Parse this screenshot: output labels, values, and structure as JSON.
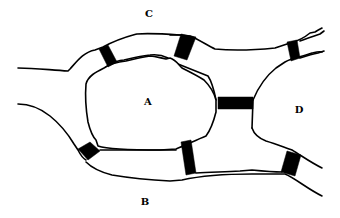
{
  "diagram": {
    "background": "#ffffff",
    "line_color": "#000000",
    "regions": [
      {
        "id": "C",
        "label": "C",
        "x": 149,
        "y": 14
      },
      {
        "id": "A",
        "label": "A",
        "x": 148,
        "y": 102
      },
      {
        "id": "D",
        "label": "D",
        "x": 299,
        "y": 110
      },
      {
        "id": "B",
        "label": "B",
        "x": 145,
        "y": 202
      }
    ],
    "bridges": [
      {
        "id": "bridge-1",
        "connects": [
          "C",
          "A"
        ]
      },
      {
        "id": "bridge-2",
        "connects": [
          "C",
          "A"
        ]
      },
      {
        "id": "bridge-3",
        "connects": [
          "C",
          "D"
        ]
      },
      {
        "id": "bridge-4",
        "connects": [
          "A",
          "D"
        ]
      },
      {
        "id": "bridge-5",
        "connects": [
          "A",
          "B"
        ]
      },
      {
        "id": "bridge-6",
        "connects": [
          "A",
          "B"
        ]
      },
      {
        "id": "bridge-7",
        "connects": [
          "B",
          "D"
        ]
      }
    ]
  }
}
